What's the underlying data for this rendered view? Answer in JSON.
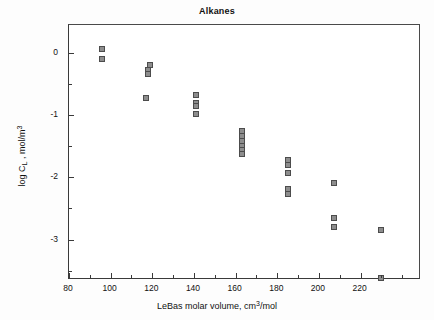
{
  "chart_data": {
    "type": "scatter",
    "title": "Alkanes",
    "xlabel_parts": {
      "pre": "LeBas molar volume, cm",
      "sup": "3",
      "post": "/mol"
    },
    "ylabel_parts": {
      "pre": "log C",
      "sub": "L",
      "mid": " , mol/m",
      "sup": "3"
    },
    "xlabel": "LeBas molar volume, cm3/mol",
    "ylabel": "log C_L , mol/m3",
    "xlim": [
      80,
      249
    ],
    "ylim": [
      -3.65,
      0.45
    ],
    "xticks": [
      80,
      100,
      120,
      140,
      160,
      180,
      200,
      220
    ],
    "xtick_labels": [
      "80",
      "100",
      "120",
      "140",
      "160",
      "180",
      "200",
      "220"
    ],
    "xminor_ticks": [
      90,
      110,
      130,
      150,
      170,
      190,
      210,
      230,
      240
    ],
    "yticks": [
      0,
      -1,
      -2,
      -3
    ],
    "ytick_labels": [
      "0",
      "-1",
      "-2",
      "-3"
    ],
    "yminor_ticks": [
      -0.5,
      -1.5,
      -2.5,
      -3.5
    ],
    "grid": false,
    "legend": null,
    "marker": {
      "shape": "square",
      "fill": "#8d8d8d",
      "edge": "#4c4c4c",
      "size_px": 6
    },
    "points": [
      {
        "x": 96,
        "y": 0.06
      },
      {
        "x": 96,
        "y": -0.09
      },
      {
        "x": 119,
        "y": -0.19
      },
      {
        "x": 118,
        "y": -0.28
      },
      {
        "x": 118,
        "y": -0.34
      },
      {
        "x": 117,
        "y": -0.72
      },
      {
        "x": 141,
        "y": -0.68
      },
      {
        "x": 141,
        "y": -0.8
      },
      {
        "x": 141,
        "y": -0.86
      },
      {
        "x": 141,
        "y": -0.98
      },
      {
        "x": 163,
        "y": -1.26
      },
      {
        "x": 163,
        "y": -1.34
      },
      {
        "x": 163,
        "y": -1.42
      },
      {
        "x": 163,
        "y": -1.5
      },
      {
        "x": 163,
        "y": -1.56
      },
      {
        "x": 163,
        "y": -1.62
      },
      {
        "x": 185,
        "y": -1.72
      },
      {
        "x": 185,
        "y": -1.8
      },
      {
        "x": 185,
        "y": -1.93
      },
      {
        "x": 185,
        "y": -2.19
      },
      {
        "x": 185,
        "y": -2.26
      },
      {
        "x": 207,
        "y": -2.09
      },
      {
        "x": 207,
        "y": -2.65
      },
      {
        "x": 207,
        "y": -2.8
      },
      {
        "x": 230,
        "y": -2.85
      },
      {
        "x": 230,
        "y": -3.62
      }
    ]
  }
}
